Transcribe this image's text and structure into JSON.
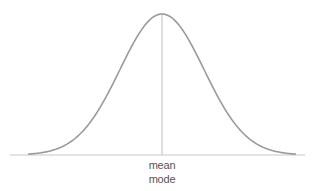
{
  "diagram": {
    "type": "normal-distribution-curve",
    "labels": {
      "center_line_line1": "mean",
      "center_line_line2": "mode"
    },
    "colors": {
      "curve": "#9a9a9a",
      "baseline": "#c8c8c8",
      "center_line": "#c8c8c8",
      "label_text": "#555555",
      "background": "#ffffff"
    }
  },
  "chart_data": {
    "type": "line",
    "title": "",
    "xlabel": "",
    "ylabel": "",
    "annotations": [
      "mean",
      "mode"
    ],
    "grid": false,
    "legend": null
  }
}
